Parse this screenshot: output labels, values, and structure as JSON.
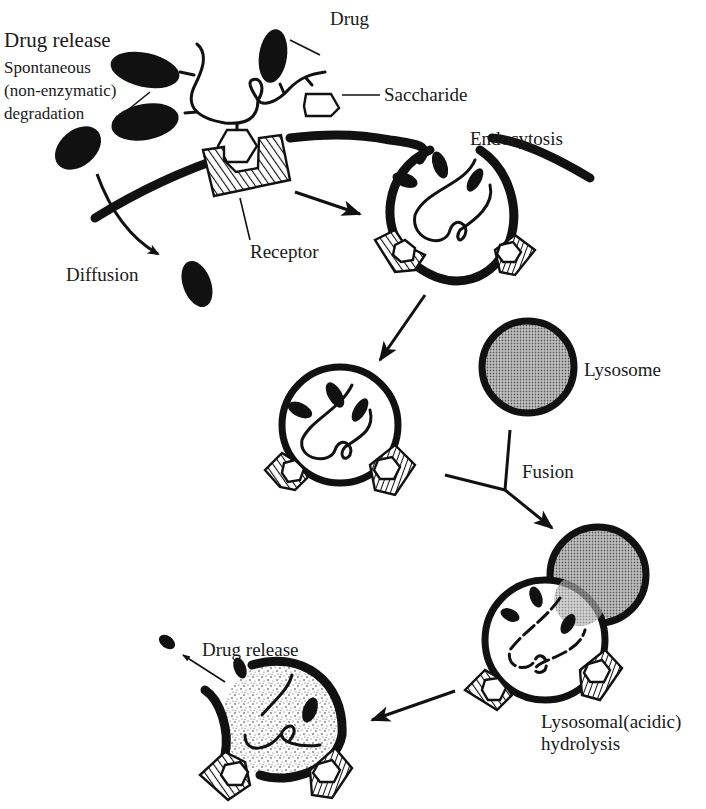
{
  "figure": {
    "type": "biological-process-diagram"
  },
  "labels": {
    "drug_release_top": "Drug release",
    "spontaneous_line1": "Spontaneous",
    "spontaneous_line2": "(non-enzymatic)",
    "spontaneous_line3": "degradation",
    "drug": "Drug",
    "saccharide": "Saccharide",
    "endocytosis": "Endocytosis",
    "receptor": "Receptor",
    "diffusion": "Diffusion",
    "lysosome": "Lysosome",
    "fusion": "Fusion",
    "lysosomal_line1": "Lysosomal(acidic)",
    "lysosomal_line2": "hydrolysis",
    "drug_release_bottom": "Drug release"
  },
  "stages": [
    {
      "id": "binding",
      "description": "Conjugate saccharide binds membrane receptor"
    },
    {
      "id": "endocytosis",
      "description": "Membrane invaginates around bound conjugate"
    },
    {
      "id": "endosome",
      "description": "Endocytic vesicle containing conjugate"
    },
    {
      "id": "fusion",
      "description": "Endosome fuses with lysosome"
    },
    {
      "id": "hydrolysis",
      "description": "Lysosomal (acidic) hydrolysis of linker"
    },
    {
      "id": "release",
      "description": "Free drug released from degraded vesicle"
    }
  ],
  "colors": {
    "ink": "#111111",
    "background": "#ffffff",
    "lysosome_fill": "#9a9a9a"
  }
}
